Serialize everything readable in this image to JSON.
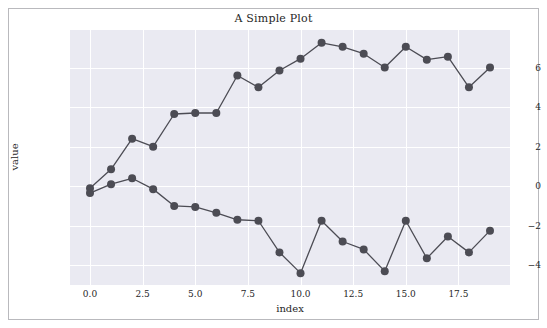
{
  "figure": {
    "background_color": "#ffffff",
    "frame_color": "#b9b9bd"
  },
  "chart_data": {
    "type": "line",
    "title": "A Simple Plot",
    "xlabel": "index",
    "ylabel": "value",
    "grid": true,
    "legend": "none",
    "plot_background_color": "#eaeaf2",
    "grid_color": "#ffffff",
    "line_color": "#4c4c54",
    "marker": "circle",
    "marker_size": 4,
    "xlim": [
      -0.95,
      19.95
    ],
    "ylim": [
      -5.0,
      7.9
    ],
    "xticks": [
      0.0,
      2.5,
      5.0,
      7.5,
      10.0,
      12.5,
      15.0,
      17.5
    ],
    "xtick_labels": [
      "0.0",
      "2.5",
      "5.0",
      "7.5",
      "10.0",
      "12.5",
      "15.0",
      "17.5"
    ],
    "yticks": [
      6,
      4,
      2,
      0,
      -2,
      -4
    ],
    "ytick_labels": [
      "6",
      "4",
      "2",
      "0",
      "−2",
      "−4"
    ],
    "x": [
      0,
      1,
      2,
      3,
      4,
      5,
      6,
      7,
      8,
      9,
      10,
      11,
      12,
      13,
      14,
      15,
      16,
      17,
      18,
      19
    ],
    "series": [
      {
        "name": "series-a",
        "color": "#4c4c54",
        "values": [
          -0.1,
          0.85,
          2.4,
          2.0,
          3.65,
          3.7,
          3.7,
          5.6,
          5.0,
          5.85,
          6.45,
          7.25,
          7.05,
          6.7,
          6.0,
          7.05,
          6.4,
          6.55,
          5.0,
          6.0
        ]
      },
      {
        "name": "series-b",
        "color": "#4c4c54",
        "values": [
          -0.35,
          0.1,
          0.4,
          -0.15,
          -1.0,
          -1.05,
          -1.35,
          -1.7,
          -1.75,
          -3.35,
          -4.4,
          -1.75,
          -2.8,
          -3.2,
          -4.3,
          -1.75,
          -3.65,
          -2.55,
          -3.35,
          -2.25
        ]
      }
    ]
  }
}
